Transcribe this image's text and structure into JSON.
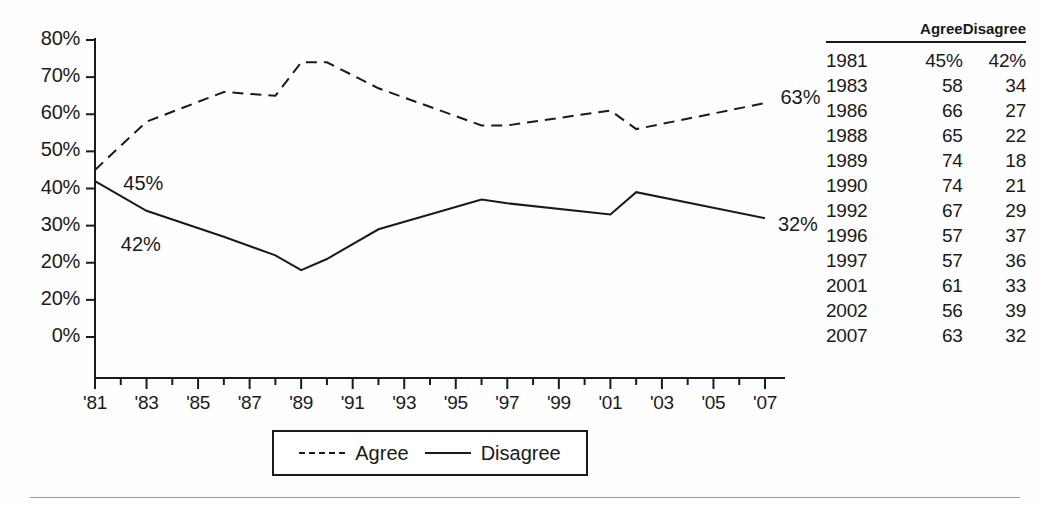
{
  "chart_data": {
    "type": "line",
    "title": "",
    "xlabel": "",
    "ylabel": "",
    "x": [
      1981,
      1983,
      1986,
      1988,
      1989,
      1990,
      1992,
      1996,
      1997,
      2001,
      2002,
      2007
    ],
    "xlim": [
      1981,
      2007
    ],
    "ylim": [
      0,
      80
    ],
    "grid": false,
    "legend_position": "bottom-center",
    "series": [
      {
        "name": "Agree",
        "style": "dashed",
        "color": "#1a1a1a",
        "values": [
          45,
          58,
          66,
          65,
          74,
          74,
          67,
          57,
          57,
          61,
          56,
          63
        ]
      },
      {
        "name": "Disagree",
        "style": "solid",
        "color": "#1a1a1a",
        "values": [
          42,
          34,
          27,
          22,
          18,
          21,
          29,
          37,
          36,
          33,
          39,
          32
        ]
      }
    ],
    "ytick_labels": [
      "80%",
      "70%",
      "60%",
      "50%",
      "40%",
      "30%",
      "20%",
      "20%",
      "0%"
    ],
    "ytick_values": [
      80,
      70,
      60,
      50,
      40,
      30,
      20,
      10,
      0
    ],
    "xtick_labels": [
      "'81",
      "'83",
      "'85",
      "'87",
      "'89",
      "'91",
      "'93",
      "'95",
      "'97",
      "'99",
      "'01",
      "'03",
      "'05",
      "'07"
    ],
    "xtick_values": [
      1981,
      1983,
      1985,
      1987,
      1989,
      1991,
      1993,
      1995,
      1997,
      1999,
      2001,
      2003,
      2005,
      2007
    ],
    "annotations": [
      {
        "text": "45%",
        "x": 1982.1,
        "y": 41.0
      },
      {
        "text": "42%",
        "x": 1982.0,
        "y": 24.5
      },
      {
        "text": "63%",
        "x": 2007.6,
        "y": 64.0
      },
      {
        "text": "32%",
        "x": 2007.5,
        "y": 30.0
      }
    ]
  },
  "legend": {
    "entries": [
      {
        "label": "Agree",
        "style": "dashed"
      },
      {
        "label": "Disagree",
        "style": "solid"
      }
    ]
  },
  "table": {
    "headers": {
      "year": "",
      "agree": "Agree",
      "disagree": "Disagree"
    },
    "rows": [
      {
        "year": "1981",
        "agree": "45%",
        "disagree": "42%"
      },
      {
        "year": "1983",
        "agree": "58",
        "disagree": "34"
      },
      {
        "year": "1986",
        "agree": "66",
        "disagree": "27"
      },
      {
        "year": "1988",
        "agree": "65",
        "disagree": "22"
      },
      {
        "year": "1989",
        "agree": "74",
        "disagree": "18"
      },
      {
        "year": "1990",
        "agree": "74",
        "disagree": "21"
      },
      {
        "year": "1992",
        "agree": "67",
        "disagree": "29"
      },
      {
        "year": "1996",
        "agree": "57",
        "disagree": "37"
      },
      {
        "year": "1997",
        "agree": "57",
        "disagree": "36"
      },
      {
        "year": "2001",
        "agree": "61",
        "disagree": "33"
      },
      {
        "year": "2002",
        "agree": "56",
        "disagree": "39"
      },
      {
        "year": "2007",
        "agree": "63",
        "disagree": "32"
      }
    ]
  }
}
